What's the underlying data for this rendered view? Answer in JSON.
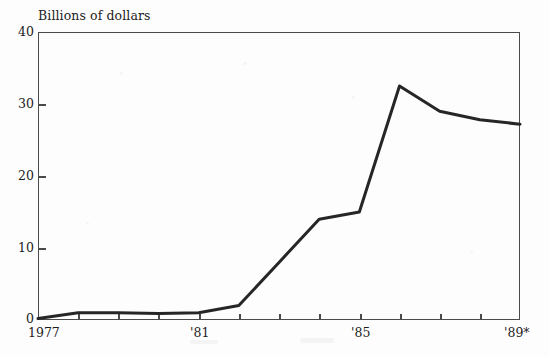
{
  "chart_data": {
    "type": "line",
    "title": "Billions of dollars",
    "xlabel": "",
    "ylabel": "Billions of dollars",
    "x": [
      1977,
      1978,
      1979,
      1980,
      1981,
      1982,
      1983,
      1984,
      1985,
      1986,
      1987,
      1988,
      1989
    ],
    "categories": [
      "1977",
      "1978",
      "1979",
      "1980",
      "1981",
      "1982",
      "1983",
      "1984",
      "1985",
      "1986",
      "1987",
      "1988",
      "1989"
    ],
    "values": [
      0.2,
      1.0,
      1.0,
      0.9,
      1.0,
      2.0,
      8.0,
      14.0,
      15.0,
      32.5,
      29.0,
      27.8,
      27.2
    ],
    "xlim": [
      1977,
      1989
    ],
    "ylim": [
      0,
      40
    ],
    "ytick_values": [
      0,
      10,
      20,
      30,
      40
    ],
    "ytick_labels": [
      "0",
      "10",
      "20",
      "30",
      "40"
    ],
    "xtick_values": [
      1977,
      1981,
      1985,
      1989
    ],
    "xtick_labels": [
      "1977",
      "'81",
      "'85",
      "'89*"
    ],
    "grid": false,
    "legend": null,
    "line_color": "#262626",
    "line_width": 3.0,
    "frame_color": "#4a4a4a",
    "background_color": "#fdfdfd",
    "footnote_marker": "*"
  }
}
